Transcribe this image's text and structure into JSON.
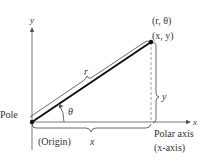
{
  "diagram": {
    "type": "polar-rectangular-coordinates",
    "labels": {
      "y_axis": "y",
      "x_axis": "x",
      "polar_point": "(r, θ)",
      "rect_point": "(x, y)",
      "radius": "r",
      "angle": "θ",
      "pole": "Pole",
      "origin": "(Origin)",
      "x_length": "x",
      "y_length": "y",
      "polar_axis": "Polar axis",
      "polar_axis_alias": "(x-axis)"
    },
    "colors": {
      "axis": "#555555",
      "ray": "#111111",
      "dashed": "#888888",
      "text": "#333333"
    }
  }
}
